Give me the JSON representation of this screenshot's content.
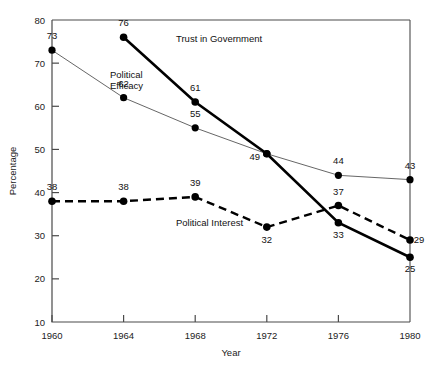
{
  "chart_data": {
    "type": "line",
    "title": "",
    "xlabel": "Year",
    "ylabel": "Percentage",
    "categories": [
      "1960",
      "1964",
      "1968",
      "1972",
      "1976",
      "1980"
    ],
    "x": [
      1960,
      1964,
      1968,
      1972,
      1976,
      1980
    ],
    "xlim": [
      1960,
      1980
    ],
    "ylim": [
      10,
      80
    ],
    "yticks": [
      "10",
      "20",
      "30",
      "40",
      "50",
      "60",
      "70",
      "80"
    ],
    "ytick_values": [
      10,
      20,
      30,
      40,
      50,
      60,
      70,
      80
    ],
    "grid": false,
    "legend_position": "inline-annotations",
    "series": [
      {
        "name": "Political Efficacy",
        "style": "thin-solid",
        "label_text": "Political\nEfficacy",
        "label_line1": "Political",
        "label_line2": "Efficacy",
        "values": [
          73,
          62,
          55,
          49,
          44,
          43
        ],
        "point_labels": [
          "73",
          "62",
          "55",
          "49",
          "44",
          "43"
        ]
      },
      {
        "name": "Trust in Government",
        "style": "thick-solid",
        "label_text": "Trust in Government",
        "values": [
          null,
          76,
          61,
          49,
          33,
          25
        ],
        "point_labels": [
          "",
          "76",
          "61",
          "49",
          "33",
          "25"
        ]
      },
      {
        "name": "Political Interest",
        "style": "thick-dashed",
        "label_text": "Political Interest",
        "values": [
          38,
          38,
          39,
          32,
          37,
          29
        ],
        "point_labels": [
          "38",
          "38",
          "39",
          "32",
          "37",
          "29"
        ]
      }
    ],
    "colors": {
      "background": "#ffffff",
      "axis": "#4a4a4a",
      "line_thin": "#555555",
      "line_thick": "#000000",
      "marker": "#000000",
      "text": "#1a1a1a"
    }
  }
}
